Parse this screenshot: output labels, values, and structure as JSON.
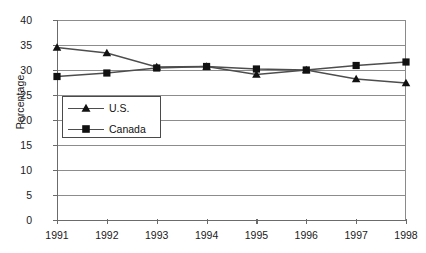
{
  "chart_data": {
    "type": "line",
    "title": "",
    "xlabel": "",
    "ylabel": "Percentage",
    "x": [
      1991,
      1992,
      1993,
      1994,
      1995,
      1996,
      1997,
      1998
    ],
    "xtick_labels": [
      "1991",
      "1992",
      "1993",
      "1994",
      "1995",
      "1996",
      "1997",
      "1998"
    ],
    "ytick_labels": [
      "40",
      "35",
      "30",
      "25",
      "20",
      "15",
      "10",
      "5",
      "0"
    ],
    "yticks": [
      40,
      35,
      30,
      25,
      20,
      15,
      10,
      5,
      0
    ],
    "ylim": [
      0,
      40
    ],
    "grid": true,
    "grid_axis": "y",
    "legend_position": "inside-left",
    "series": [
      {
        "name": "U.S.",
        "marker": "triangle",
        "color": "#111111",
        "values": [
          34.5,
          33.4,
          30.6,
          30.7,
          29.1,
          30.0,
          28.2,
          27.4
        ]
      },
      {
        "name": "Canada",
        "marker": "square",
        "color": "#111111",
        "values": [
          28.7,
          29.4,
          30.4,
          30.7,
          30.2,
          30.0,
          30.9,
          31.6
        ]
      }
    ]
  },
  "legend": {
    "entries": [
      {
        "label": "U.S."
      },
      {
        "label": "Canada"
      }
    ]
  },
  "colors": {
    "line": "#4d4d4d",
    "marker": "#111111",
    "grid": "#8c8c8c",
    "axis": "#6b6b6b",
    "text": "#1a1a1a",
    "background": "#ffffff"
  }
}
